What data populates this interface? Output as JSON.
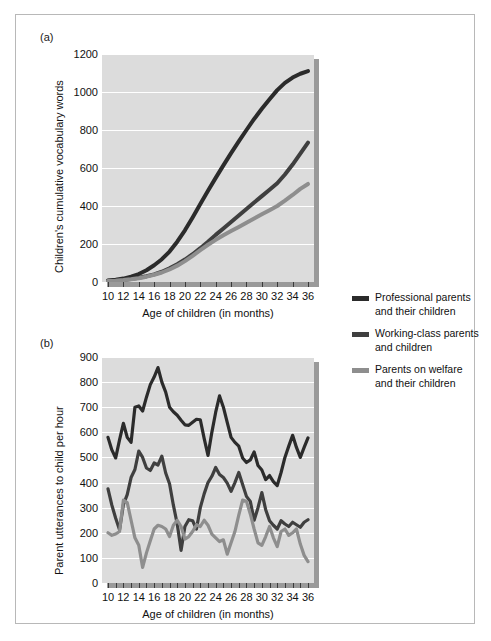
{
  "figure": {
    "panel_a_letter": "(a)",
    "panel_b_letter": "(b)"
  },
  "legend": {
    "position": "right",
    "items": [
      {
        "name": "professional",
        "line1": "Professional parents",
        "line2": "and their children",
        "color": "#2b2b2b"
      },
      {
        "name": "working-class",
        "line1": "Working-class parents",
        "line2": "and children",
        "color": "#3f3f3f"
      },
      {
        "name": "welfare",
        "line1": "Parents on welfare",
        "line2": "and their children",
        "color": "#8e8e8e"
      }
    ]
  },
  "chart_data": [
    {
      "id": "panel-a",
      "type": "line",
      "title": "(a)",
      "xlabel": "Age of children (in months)",
      "ylabel": "Children's cumulative vocabulary words",
      "xlim": [
        10,
        36
      ],
      "ylim": [
        0,
        1200
      ],
      "ytick_labels": [
        "0",
        "200",
        "400",
        "600",
        "800",
        "1000",
        "1200"
      ],
      "yticks": [
        0,
        200,
        400,
        600,
        800,
        1000,
        1200
      ],
      "xtick_labels": [
        "10",
        "12",
        "14",
        "16",
        "18",
        "20",
        "22",
        "24",
        "26",
        "28",
        "30",
        "32",
        "34",
        "36"
      ],
      "xticks": [
        10,
        12,
        14,
        16,
        18,
        20,
        22,
        24,
        26,
        28,
        30,
        32,
        34,
        36
      ],
      "xtick_step": 2,
      "grid": true,
      "grid_color": "#ffffff",
      "plot_bg": "#dcdcdc",
      "x": [
        10,
        11,
        12,
        13,
        14,
        15,
        16,
        17,
        18,
        19,
        20,
        21,
        22,
        23,
        24,
        25,
        26,
        27,
        28,
        29,
        30,
        31,
        32,
        33,
        34,
        35,
        36
      ],
      "series": [
        {
          "name": "Professional parents and their children",
          "color": "#2b2b2b",
          "values": [
            8,
            12,
            18,
            28,
            42,
            62,
            88,
            120,
            160,
            212,
            272,
            340,
            410,
            480,
            548,
            614,
            678,
            740,
            800,
            858,
            912,
            962,
            1010,
            1048,
            1076,
            1096,
            1110
          ]
        },
        {
          "name": "Working-class parents and children",
          "color": "#3f3f3f",
          "values": [
            6,
            8,
            11,
            16,
            22,
            30,
            40,
            54,
            72,
            94,
            118,
            146,
            178,
            212,
            248,
            282,
            316,
            350,
            384,
            418,
            452,
            486,
            520,
            566,
            618,
            676,
            734
          ]
        },
        {
          "name": "Parents on welfare and their children",
          "color": "#8e8e8e",
          "values": [
            5,
            7,
            10,
            14,
            20,
            28,
            38,
            50,
            66,
            86,
            110,
            138,
            168,
            196,
            222,
            246,
            268,
            290,
            312,
            334,
            356,
            378,
            400,
            428,
            458,
            490,
            516
          ]
        }
      ]
    },
    {
      "id": "panel-b",
      "type": "line",
      "title": "(b)",
      "xlabel": "Age of children (in months)",
      "ylabel": "Parent utterances to child per hour",
      "xlim": [
        10,
        36
      ],
      "ylim": [
        0,
        900
      ],
      "ytick_labels": [
        "0",
        "100",
        "200",
        "300",
        "400",
        "500",
        "600",
        "700",
        "800",
        "900"
      ],
      "yticks": [
        0,
        100,
        200,
        300,
        400,
        500,
        600,
        700,
        800,
        900
      ],
      "xtick_labels": [
        "10",
        "12",
        "14",
        "16",
        "18",
        "20",
        "22",
        "24",
        "26",
        "28",
        "30",
        "32",
        "34",
        "36"
      ],
      "xticks": [
        10,
        11,
        12,
        13,
        14,
        15,
        16,
        17,
        18,
        19,
        20,
        21,
        22,
        23,
        24,
        25,
        26,
        27,
        28,
        29,
        30,
        31,
        32,
        33,
        34,
        35,
        36
      ],
      "xtick_step": 1,
      "grid": true,
      "grid_color": "#ffffff",
      "plot_bg": "#dcdcdc",
      "x": [
        10,
        10.5,
        11,
        11.5,
        12,
        12.5,
        13,
        13.5,
        14,
        14.5,
        15,
        15.5,
        16,
        16.5,
        17,
        17.5,
        18,
        18.5,
        19,
        19.5,
        20,
        20.5,
        21,
        21.5,
        22,
        22.5,
        23,
        23.5,
        24,
        24.5,
        25,
        25.5,
        26,
        26.5,
        27,
        27.5,
        28,
        28.5,
        29,
        29.5,
        30,
        30.5,
        31,
        31.5,
        32,
        32.5,
        33,
        33.5,
        34,
        34.5,
        35,
        35.5,
        36
      ],
      "series": [
        {
          "name": "Professional parents and their children",
          "color": "#2b2b2b",
          "values": [
            580,
            530,
            498,
            570,
            636,
            580,
            560,
            700,
            705,
            685,
            740,
            790,
            820,
            858,
            800,
            760,
            700,
            682,
            668,
            648,
            630,
            628,
            640,
            652,
            650,
            576,
            508,
            600,
            680,
            745,
            700,
            640,
            580,
            560,
            545,
            498,
            480,
            490,
            522,
            468,
            450,
            412,
            428,
            404,
            388,
            440,
            500,
            545,
            588,
            540,
            500,
            540,
            578
          ]
        },
        {
          "name": "Working-class parents and children",
          "color": "#3f3f3f",
          "values": [
            375,
            310,
            258,
            212,
            312,
            352,
            420,
            452,
            525,
            500,
            458,
            448,
            478,
            470,
            505,
            438,
            395,
            310,
            235,
            130,
            225,
            252,
            248,
            215,
            300,
            355,
            400,
            425,
            460,
            432,
            420,
            398,
            365,
            400,
            440,
            392,
            345,
            325,
            250,
            300,
            360,
            292,
            248,
            230,
            215,
            248,
            235,
            225,
            242,
            232,
            222,
            242,
            252
          ]
        },
        {
          "name": "Parents on welfare and their children",
          "color": "#8e8e8e",
          "values": [
            200,
            190,
            195,
            205,
            330,
            320,
            250,
            180,
            150,
            62,
            120,
            168,
            215,
            230,
            225,
            215,
            185,
            230,
            250,
            225,
            175,
            185,
            205,
            232,
            225,
            250,
            230,
            195,
            180,
            165,
            172,
            115,
            160,
            205,
            270,
            330,
            325,
            275,
            215,
            160,
            150,
            185,
            225,
            180,
            145,
            205,
            215,
            190,
            200,
            215,
            155,
            110,
            85
          ]
        }
      ]
    }
  ]
}
